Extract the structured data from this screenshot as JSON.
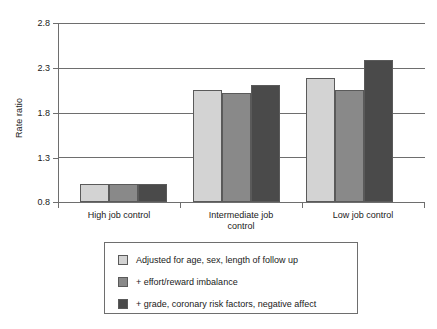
{
  "chart_data": {
    "type": "bar",
    "title": "",
    "subtitle": "",
    "xlabel": "",
    "ylabel": "Rate ratio",
    "ylim": [
      0.8,
      2.8
    ],
    "yticks": [
      "0.8",
      "1.3",
      "1.8",
      "2.3",
      "2.8"
    ],
    "ytick_values": [
      0.8,
      1.3,
      1.8,
      2.3,
      2.8
    ],
    "grid": true,
    "legend_position": "below-plot",
    "categories": [
      "High job control",
      "Intermediate job control",
      "Low job control"
    ],
    "category_label_lines": [
      [
        "High job control"
      ],
      [
        "Intermediate job",
        "control"
      ],
      [
        "Low job control"
      ]
    ],
    "series": [
      {
        "name": "Adjusted for age, sex, length of follow up",
        "color": "#d3d3d3",
        "values": [
          1.0,
          2.05,
          2.18
        ]
      },
      {
        "name": "+ effort/reward imbalance",
        "color": "#898989",
        "values": [
          1.0,
          2.02,
          2.05
        ]
      },
      {
        "name": "+ grade, coronary risk factors, negative affect",
        "color": "#4a4a4a",
        "values": [
          1.0,
          2.11,
          2.39
        ]
      }
    ]
  },
  "axes": {
    "y_title": "Rate ratio",
    "y_tick_labels": [
      "2.8",
      "2.3",
      "1.8",
      "1.3",
      "0.8"
    ],
    "x_tick_labels": [
      "High job control",
      "Intermediate job control",
      "Low job control"
    ]
  },
  "legend": {
    "items": [
      {
        "label": "Adjusted for age, sex, length of follow up",
        "color": "#d3d3d3"
      },
      {
        "label": "+ effort/reward imbalance",
        "color": "#898989"
      },
      {
        "label": "+ grade, coronary risk factors, negative affect",
        "color": "#4a4a4a"
      }
    ]
  },
  "colors": {
    "series_light": "#d3d3d3",
    "series_medium": "#898989",
    "series_dark": "#4a4a4a",
    "axis": "#6e6e6e",
    "text": "#1a1a1a",
    "background": "#ffffff"
  }
}
